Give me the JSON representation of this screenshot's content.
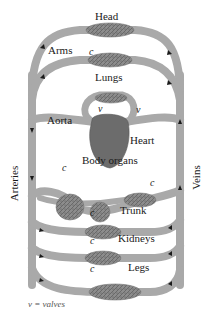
{
  "diagram": {
    "type": "circulatory-system-schematic",
    "colors": {
      "vessel": "#a9a9a9",
      "vessel_edge": "#7a7a7a",
      "capillary_bed": "#8c8c8c",
      "capillary_texture": "#5e5e5e",
      "heart": "#6c6c6c",
      "arrow": "#1a1a1a",
      "background": "#ffffff"
    },
    "labels": {
      "head": "Head",
      "arms": "Arms",
      "lungs": "Lungs",
      "aorta": "Aorta",
      "heart": "Heart",
      "body_organs": "Body organs",
      "trunk": "Trunk",
      "kidneys": "Kidneys",
      "legs": "Legs",
      "arteries": "Arteries",
      "veins": "Veins"
    },
    "markers": {
      "capillary": "c",
      "valve": "v"
    },
    "legend_partial": "v = valves"
  }
}
